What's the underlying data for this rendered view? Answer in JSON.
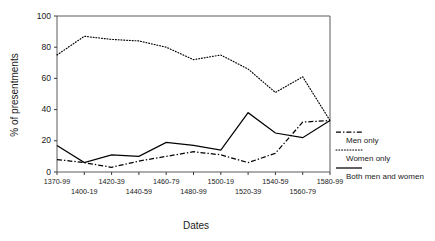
{
  "chart_data": {
    "type": "line",
    "title": "",
    "xlabel": "Dates",
    "ylabel": "% of presentments",
    "categories": [
      "1370-99",
      "1400-19",
      "1420-39",
      "1440-59",
      "1460-79",
      "1480-99",
      "1500-19",
      "1520-39",
      "1540-59",
      "1560-79",
      "1580-99"
    ],
    "ylim": [
      0,
      100
    ],
    "yticks": [
      0,
      20,
      40,
      60,
      80,
      100
    ],
    "grid": false,
    "legend_position": "right",
    "series": [
      {
        "name": "Men only",
        "style": "dash-dot",
        "color": "#000000",
        "values": [
          8,
          6,
          3,
          7,
          10,
          13,
          11,
          6,
          12,
          32,
          33
        ]
      },
      {
        "name": "Women only",
        "style": "dotted",
        "color": "#000000",
        "values": [
          75,
          87,
          85,
          84,
          80,
          72,
          75,
          66,
          51,
          61,
          33
        ]
      },
      {
        "name": "Both men and women",
        "style": "solid",
        "color": "#000000",
        "values": [
          17,
          6,
          11,
          10,
          19,
          17,
          14,
          38,
          25,
          22,
          33
        ]
      }
    ]
  },
  "legend": {
    "items": [
      {
        "label": "Men only",
        "style": "dash-dot"
      },
      {
        "label": "Women only",
        "style": "dotted"
      },
      {
        "label": "Both men and women",
        "style": "solid"
      }
    ]
  },
  "axes": {
    "x_title": "Dates",
    "y_title": "% of presentments",
    "y_tick_labels": [
      "0",
      "20",
      "40",
      "60",
      "80",
      "100"
    ],
    "x_tick_labels_top_row": [
      "1370-99",
      "1420-39",
      "1460-79",
      "1500-19",
      "1540-59",
      "1580-99"
    ],
    "x_tick_labels_bottom_row": [
      "1400-19",
      "1440-59",
      "1480-99",
      "1520-39",
      "1560-79"
    ]
  }
}
